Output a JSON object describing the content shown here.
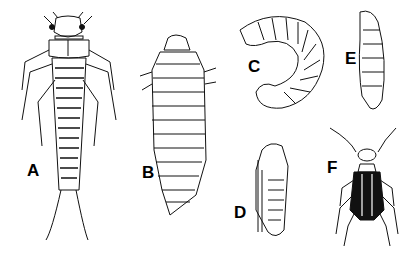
{
  "figure": {
    "panels": [
      {
        "label": "A",
        "subject": "elongate larva with legs, antennae and caudal filaments"
      },
      {
        "label": "B",
        "subject": "segmented grub-like larva"
      },
      {
        "label": "C",
        "subject": "C-shaped curled grub"
      },
      {
        "label": "D",
        "subject": "pupa"
      },
      {
        "label": "E",
        "subject": "elongate curved larva"
      },
      {
        "label": "F",
        "subject": "adult striped blister beetle"
      }
    ]
  }
}
